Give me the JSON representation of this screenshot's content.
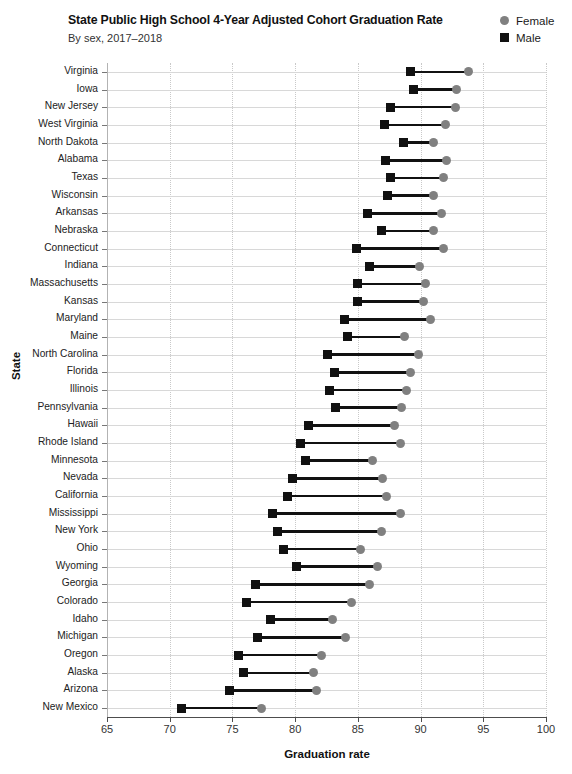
{
  "header": {
    "title": "State Public High School 4-Year Adjusted Cohort Graduation Rate",
    "subtitle": "By sex, 2017–2018"
  },
  "legend": {
    "position": "top-right",
    "items": [
      {
        "label": "Female",
        "marker": "circle-icon",
        "color": "#808080"
      },
      {
        "label": "Male",
        "marker": "square-icon",
        "color": "#111111"
      }
    ]
  },
  "axes": {
    "x_title": "Graduation rate",
    "y_title": "State",
    "x_ticks": [
      "65",
      "70",
      "75",
      "80",
      "85",
      "90",
      "95",
      "100"
    ]
  },
  "chart_data": {
    "type": "bar",
    "subtype": "dumbbell",
    "title": "State Public High School 4-Year Adjusted Cohort Graduation Rate",
    "subtitle": "By sex, 2017–2018",
    "xlabel": "Graduation rate",
    "ylabel": "State",
    "xlim": [
      65,
      100
    ],
    "xticks": [
      65,
      70,
      75,
      80,
      85,
      90,
      95,
      100
    ],
    "grid": "vertical-dotted-and-horizontal-solid",
    "legend_position": "top-right",
    "categories": [
      "Virginia",
      "Iowa",
      "New Jersey",
      "West Virginia",
      "North Dakota",
      "Alabama",
      "Texas",
      "Wisconsin",
      "Arkansas",
      "Nebraska",
      "Connecticut",
      "Indiana",
      "Massachusetts",
      "Kansas",
      "Maryland",
      "Maine",
      "North Carolina",
      "Florida",
      "Illinois",
      "Pennsylvania",
      "Hawaii",
      "Rhode Island",
      "Minnesota",
      "Nevada",
      "California",
      "Mississippi",
      "New York",
      "Ohio",
      "Wyoming",
      "Georgia",
      "Colorado",
      "Idaho",
      "Michigan",
      "Oregon",
      "Alaska",
      "Arizona",
      "New Mexico"
    ],
    "series": [
      {
        "name": "Female",
        "color": "#808080",
        "marker": "circle",
        "values": [
          93.8,
          92.9,
          92.8,
          92.0,
          91.0,
          92.1,
          91.8,
          91.0,
          91.7,
          91.0,
          91.8,
          89.9,
          90.4,
          90.2,
          90.8,
          88.7,
          89.8,
          89.2,
          88.9,
          88.5,
          87.9,
          88.4,
          86.2,
          87.0,
          87.3,
          88.4,
          86.9,
          85.2,
          86.6,
          85.9,
          84.5,
          83.0,
          84.0,
          82.1,
          81.5,
          81.7,
          77.3
        ]
      },
      {
        "name": "Male",
        "color": "#111111",
        "marker": "square",
        "values": [
          89.2,
          89.4,
          87.6,
          87.1,
          88.6,
          87.2,
          87.6,
          87.4,
          85.8,
          86.9,
          84.9,
          85.9,
          85.0,
          85.0,
          83.9,
          84.2,
          82.6,
          83.1,
          82.7,
          83.2,
          81.1,
          80.4,
          80.8,
          79.8,
          79.4,
          78.2,
          78.6,
          79.1,
          80.1,
          76.8,
          76.1,
          78.0,
          77.0,
          75.5,
          75.9,
          74.8,
          70.9
        ]
      }
    ]
  }
}
